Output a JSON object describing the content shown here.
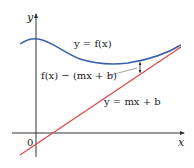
{
  "diagram": {
    "type": "function-with-slant-asymptote",
    "axes": {
      "x_label": "x",
      "y_label": "y",
      "origin_label": "0"
    },
    "curves": [
      {
        "name": "f",
        "label": "y = f(x)",
        "color": "#3a5fa8"
      },
      {
        "name": "asymptote",
        "label": "y = mx + b",
        "color": "#d9494f"
      }
    ],
    "annotation": {
      "label": "f(x) − (mx + b)",
      "meaning": "vertical distance between curve and asymptote"
    },
    "colors": {
      "axis": "#333333",
      "curve": "#3a5fa8",
      "line": "#d9494f",
      "leader": "#666666"
    }
  }
}
